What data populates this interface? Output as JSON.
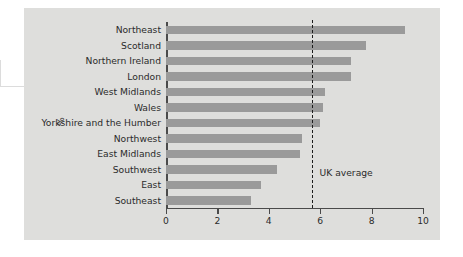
{
  "chart_data": {
    "type": "bar",
    "orientation": "horizontal",
    "title": "",
    "xlabel": "",
    "ylabel": "%",
    "categories": [
      "Northeast",
      "Scotland",
      "Northern Ireland",
      "London",
      "West Midlands",
      "Wales",
      "Yorkshire and the Humber",
      "Northwest",
      "East Midlands",
      "Southwest",
      "East",
      "Southeast"
    ],
    "values": [
      9.3,
      7.8,
      7.2,
      7.2,
      6.2,
      6.1,
      6.0,
      5.3,
      5.2,
      4.3,
      3.7,
      3.3
    ],
    "xlim": [
      0,
      10
    ],
    "xticks": [
      0,
      2,
      4,
      6,
      8,
      10
    ],
    "xtick_labels": [
      "0",
      "2",
      "4",
      "6",
      "8",
      "10"
    ],
    "grid": false,
    "legend": false,
    "bar_color": "#9a9a9a",
    "background_color": "#dededc",
    "annotations": [
      {
        "name": "uk-average-line",
        "label": "UK average",
        "value": 5.7,
        "style": "dashed",
        "color": "#1c1c1c"
      }
    ]
  }
}
